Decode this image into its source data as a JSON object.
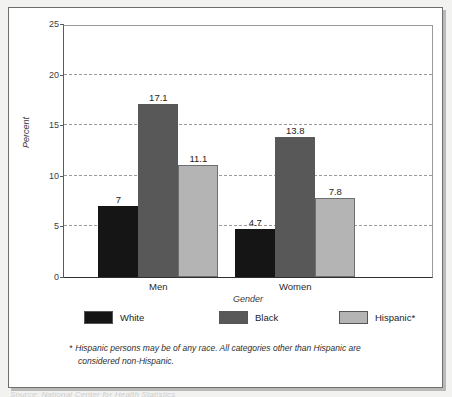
{
  "chart_data": {
    "type": "bar",
    "title": "",
    "xlabel": "Gender",
    "ylabel": "Percent",
    "ylim": [
      0,
      25
    ],
    "yticks": [
      0,
      5,
      10,
      15,
      20,
      25
    ],
    "ytick_labels": [
      "0",
      "5",
      "10",
      "15",
      "20",
      "25"
    ],
    "grid": "horizontal-dashed",
    "grid_values": [
      5,
      10,
      15,
      20
    ],
    "legend_position": "below-axes",
    "categories": [
      "Men",
      "Women"
    ],
    "series": [
      {
        "name": "White",
        "color": "#151515",
        "values": [
          7,
          4.7
        ],
        "labels": [
          "7",
          "4.7"
        ]
      },
      {
        "name": "Black",
        "color": "#585858",
        "values": [
          17.1,
          13.8
        ],
        "labels": [
          "17.1",
          "13.8"
        ]
      },
      {
        "name": "Hispanic*",
        "color": "#b4b4b4",
        "values": [
          11.1,
          7.8
        ],
        "labels": [
          "11.1",
          "7.8"
        ]
      }
    ],
    "annotations": [
      "* Hispanic persons may be of any race. All categories other than Hispanic are",
      "considered non-Hispanic."
    ]
  },
  "footnote": {
    "star": "*",
    "line1": "Hispanic persons may be of any race. All categories other than Hispanic are",
    "line2": "considered non-Hispanic."
  },
  "colors": {
    "white_series": "#151515",
    "black_series": "#585858",
    "hispanic_series": "#b4b4b4",
    "frame_border": "#6e6e6e",
    "gridline": "#9b9b9b",
    "axis": "#2f2f2f"
  },
  "caption_strip": "Source: National Center for Health Statistics"
}
